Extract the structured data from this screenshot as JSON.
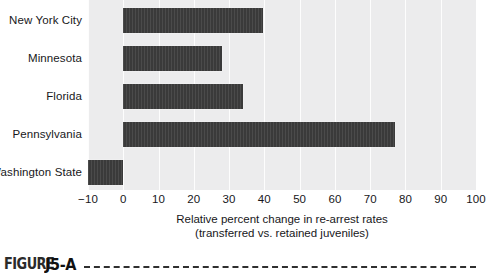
{
  "chart_data": {
    "type": "bar",
    "orientation": "horizontal",
    "title": "",
    "xlabel": "Relative percent change in re-arrest rates",
    "xlabel_line2": "(transferred vs. retained juveniles)",
    "ylabel": "",
    "xlim": [
      -10,
      100
    ],
    "xticks": [
      -10,
      0,
      10,
      20,
      30,
      40,
      50,
      60,
      70,
      80,
      90,
      100
    ],
    "xtick_labels": [
      "−10",
      "0",
      "10",
      "20",
      "30",
      "40",
      "50",
      "60",
      "70",
      "80",
      "90",
      "100"
    ],
    "grid": true,
    "grid_color": "#fdfdfd",
    "plot_background": "#ececed",
    "bar_color": "#3a3a3a",
    "legend": null,
    "categories": [
      "New York City",
      "Minnesota",
      "Florida",
      "Pennsylvania",
      "Washington State"
    ],
    "values": [
      39.5,
      28,
      34,
      77,
      -10
    ],
    "bars": [
      {
        "category": "New York City",
        "value": 39.5
      },
      {
        "category": "Minnesota",
        "value": 28
      },
      {
        "category": "Florida",
        "value": 34
      },
      {
        "category": "Pennsylvania",
        "value": 77
      },
      {
        "category": "Washington State",
        "value": -10
      }
    ]
  },
  "caption": {
    "word": "FIGURE",
    "number": "J5-A"
  }
}
